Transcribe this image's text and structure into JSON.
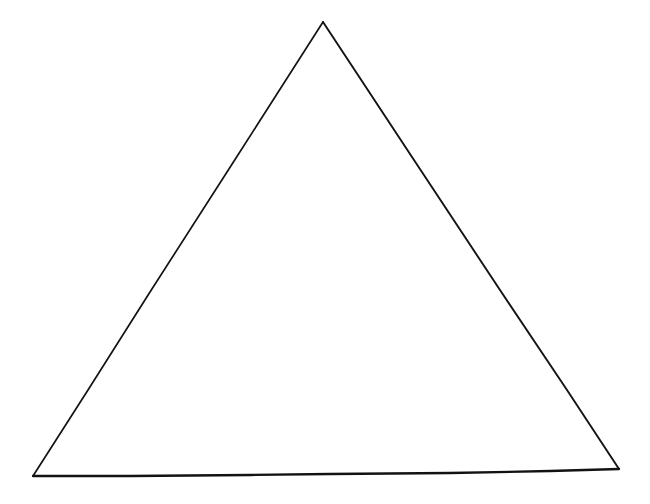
{
  "canvas": {
    "width": 650,
    "height": 504,
    "background_color": "#ffffff",
    "description": "Blank white page containing a single hand-drawn triangle outline"
  },
  "figure": {
    "name": "triangle",
    "shape_type": "triangle",
    "label": "",
    "fill_color": "none",
    "stroke_color": "#131313",
    "stroke_width": 1.8,
    "vertices": [
      {
        "name": "apex",
        "x": 323,
        "y": 22
      },
      {
        "name": "bottom-right",
        "x": 619,
        "y": 469
      },
      {
        "name": "bottom-left",
        "x": 33,
        "y": 476
      }
    ],
    "edges": [
      {
        "name": "left-edge",
        "from": "apex",
        "to": "bottom-left",
        "stroke_color": "#131313",
        "stroke_width": 1.7,
        "path": "M 323 22 L 236 158 L 150 292 L 88 390 L 33 476"
      },
      {
        "name": "right-edge",
        "from": "apex",
        "to": "bottom-right",
        "stroke_color": "#131313",
        "stroke_width": 1.9,
        "path": "M 323 22 L 412 157 L 500 290 L 567 390 L 619 469"
      },
      {
        "name": "bottom-edge",
        "from": "bottom-left",
        "to": "bottom-right",
        "stroke_color": "#121212",
        "stroke_width": 2.3,
        "path": "M 33 476 L 130 476 L 250 475 L 330 474 L 450 473 L 550 471 L 619 469"
      }
    ]
  }
}
